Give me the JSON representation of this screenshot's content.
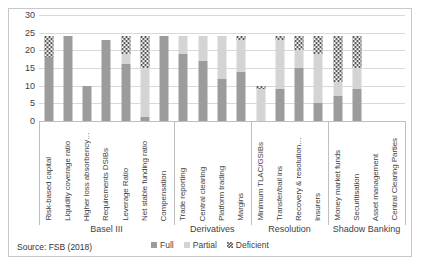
{
  "source_note": "Source: FSB (2018)",
  "caption": "",
  "legend": {
    "position": "bottom",
    "items": [
      {
        "label": "Full",
        "key": "full",
        "color": "#9c9c9c"
      },
      {
        "label": "Partial",
        "key": "partial",
        "color": "#d4d4d4"
      },
      {
        "label": "Deficient",
        "key": "deficient",
        "color": "#5a5a5a"
      }
    ]
  },
  "groups": [
    {
      "label": "Basel III",
      "count": 7
    },
    {
      "label": "Derivatives",
      "count": 4
    },
    {
      "label": "Resolution",
      "count": 4
    },
    {
      "label": "Shadow Banking",
      "count": 4
    }
  ],
  "chart_data": {
    "type": "bar",
    "title": "",
    "xlabel": "",
    "ylabel": "",
    "ylim": [
      0,
      30
    ],
    "yticks": [
      0,
      5,
      10,
      15,
      20,
      25,
      30
    ],
    "grid": true,
    "stacked": true,
    "legend_position": "bottom",
    "categories": [
      "Risk-based capital",
      "Liquidity coverage ratio",
      "Higher loss absorbency…",
      "Requirements DSIBs",
      "Leverage Ratio",
      "Net stable funding ratio",
      "Compensation",
      "Trade reporting",
      "Central clearing",
      "Platform trading",
      "Margins",
      "Minimum TLAC/GSIBs",
      "Transfer/bail ins",
      "Recovery & resolution…",
      "Insurers",
      "Money market funds",
      "Securitisation",
      "Asset management",
      "Central Clearing Parties"
    ],
    "series": [
      {
        "name": "Full",
        "color": "#9c9c9c",
        "values": [
          18,
          24,
          10,
          23,
          16,
          1,
          24,
          19,
          17,
          12,
          14,
          0,
          9,
          15,
          5,
          7,
          9,
          0,
          0
        ]
      },
      {
        "name": "Partial",
        "color": "#d4d4d4",
        "values": [
          0,
          0,
          0,
          0,
          3,
          14,
          0,
          5,
          7,
          12,
          9,
          9,
          14,
          5,
          14,
          4,
          6,
          0,
          0
        ]
      },
      {
        "name": "Deficient",
        "color": "#5a5a5a",
        "values": [
          6,
          0,
          0,
          0,
          5,
          9,
          0,
          0,
          0,
          0,
          1,
          1,
          1,
          4,
          5,
          13,
          9,
          0,
          0
        ]
      }
    ],
    "totals": [
      24,
      24,
      10,
      23,
      24,
      24,
      24,
      24,
      24,
      24,
      24,
      10,
      24,
      24,
      24,
      24,
      24,
      0,
      0
    ]
  }
}
